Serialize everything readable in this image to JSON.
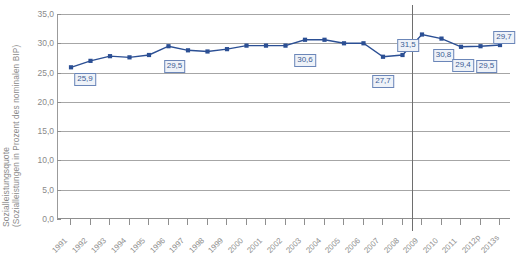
{
  "chart_data": {
    "type": "line",
    "title": "",
    "subtitle": "",
    "xlabel": "",
    "ylabel": "Sozialleistungsquote",
    "ylabel_sub": "(Sozialleistungen in Prozent des nominalen BIP)",
    "categories": [
      "1991",
      "1992",
      "1993",
      "1994",
      "1995",
      "1996",
      "1997",
      "1998",
      "1999",
      "2000",
      "2001",
      "2002",
      "2003",
      "2004",
      "2005",
      "2006",
      "2007",
      "2008",
      "2009",
      "2010",
      "2011",
      "2012p",
      "2013s"
    ],
    "values": [
      25.9,
      27.0,
      27.8,
      27.6,
      28.0,
      29.5,
      28.8,
      28.6,
      29.0,
      29.6,
      29.6,
      29.6,
      30.6,
      30.6,
      30.0,
      30.0,
      27.7,
      28.0,
      31.5,
      30.8,
      29.4,
      29.5,
      29.7
    ],
    "series": [
      {
        "name": "Sozialleistungsquote",
        "color": "#2b4f94",
        "values": [
          25.9,
          27.0,
          27.8,
          27.6,
          28.0,
          29.5,
          28.8,
          28.6,
          29.0,
          29.6,
          29.6,
          29.6,
          30.6,
          30.6,
          30.0,
          30.0,
          27.7,
          28.0,
          31.5,
          30.8,
          29.4,
          29.5,
          29.7
        ]
      }
    ],
    "ylim": [
      0,
      35
    ],
    "yticks": [
      0,
      5,
      10,
      15,
      20,
      25,
      30,
      35
    ],
    "ytick_labels": [
      "0,0",
      "5,0",
      "10,0",
      "15,0",
      "20,0",
      "25,0",
      "30,0",
      "35,0"
    ],
    "grid": true,
    "legend": "none",
    "break_after_category": "2008",
    "data_labels": [
      {
        "category": "1991",
        "value": 25.9,
        "text": "25,9"
      },
      {
        "category": "1996",
        "value": 29.5,
        "text": "29,5"
      },
      {
        "category": "2003",
        "value": 30.6,
        "text": "30,6"
      },
      {
        "category": "2007",
        "value": 27.7,
        "text": "27,7"
      },
      {
        "category": "2009",
        "value": 31.5,
        "text": "31,5"
      },
      {
        "category": "2010",
        "value": 30.8,
        "text": "30,8"
      },
      {
        "category": "2011",
        "value": 29.4,
        "text": "29,4"
      },
      {
        "category": "2012p",
        "value": 29.5,
        "text": "29,5"
      },
      {
        "category": "2013s",
        "value": 29.7,
        "text": "29,7"
      }
    ],
    "colors": {
      "line": "#2b4f94",
      "marker": "#2b4f94",
      "grid": "#a6a6a6",
      "axis": "#8f8f8f",
      "tick_text": "#8a8a8a",
      "callout_bg": "#eef2f8",
      "callout_border": "#6b86b8",
      "callout_text": "#3c5d96",
      "separator": "#6e6e6e"
    }
  }
}
